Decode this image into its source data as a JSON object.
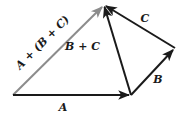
{
  "diagram": {
    "colors": {
      "dark": "#1a1a1a",
      "resultant": "#8c8c8c",
      "background": "#ffffff"
    },
    "points": {
      "origin": [
        13,
        95
      ],
      "a_end": [
        131,
        95
      ],
      "b_end": [
        175,
        48
      ],
      "apex": [
        104,
        5
      ]
    },
    "vectors": [
      {
        "id": "A",
        "label": "A",
        "from": "origin",
        "to": "a_end"
      },
      {
        "id": "B",
        "label": "B",
        "from": "a_end",
        "to": "b_end"
      },
      {
        "id": "C",
        "label": "C",
        "from": "b_end",
        "to": "apex"
      },
      {
        "id": "B+C",
        "label": "B + C",
        "from": "a_end",
        "to": "apex"
      },
      {
        "id": "A+(B+C)",
        "label": "A + (B + C)",
        "from": "origin",
        "to": "apex"
      }
    ],
    "labels": {
      "a": "A",
      "b": "B",
      "c": "C",
      "b_plus_c": "B + C",
      "resultant": "A + (B + C)"
    }
  }
}
